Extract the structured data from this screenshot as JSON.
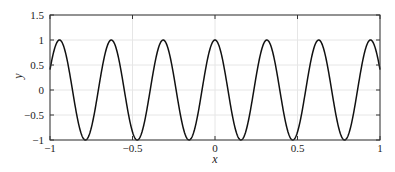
{
  "chart_data": {
    "type": "line",
    "title": "",
    "xlabel": "x",
    "ylabel": "y",
    "xlim": [
      -1,
      1
    ],
    "ylim": [
      -1,
      1.5
    ],
    "grid": true,
    "legend": null,
    "x_ticks": [
      -1,
      -0.5,
      0,
      0.5,
      1
    ],
    "x_tick_labels": [
      "−1",
      "−0.5",
      "0",
      "0.5",
      "1"
    ],
    "y_ticks": [
      -1,
      -0.5,
      0,
      0.5,
      1,
      1.5
    ],
    "y_tick_labels": [
      "−1",
      "−0.5",
      "0",
      "0.5",
      "1",
      "1.5"
    ],
    "series": [
      {
        "name": "y = cos(20x)",
        "function": "cos(20*x)",
        "color": "#111111",
        "sample_x": [
          -1,
          -0.9425,
          -0.7854,
          -0.6283,
          -0.4712,
          -0.3142,
          -0.1571,
          0,
          0.1571,
          0.3142,
          0.4712,
          0.6283,
          0.7854,
          0.9425,
          1
        ],
        "sample_y": [
          0.408,
          1,
          -1,
          1,
          -1,
          1,
          -1,
          1,
          -1,
          1,
          -1,
          1,
          -1,
          1,
          0.408
        ]
      }
    ]
  }
}
